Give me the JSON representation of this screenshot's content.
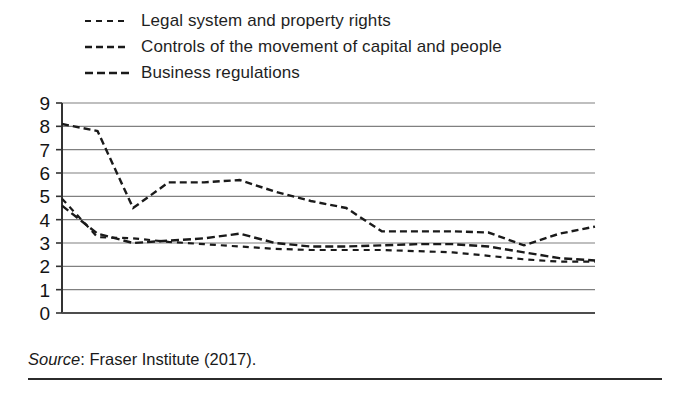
{
  "figure": {
    "caption_source_word": "Source",
    "caption_rest": ": Fraser Institute (2017).",
    "caption_full": "Source: Fraser Institute (2017)."
  },
  "legend": {
    "position": "top-left",
    "items": [
      {
        "label": "Legal system and property rights",
        "dash": "6,5",
        "width": 2.2,
        "color": "#1a1a1a"
      },
      {
        "label": "Controls of the movement of capital and people",
        "dash": "7,4",
        "width": 2.4,
        "color": "#1a1a1a"
      },
      {
        "label": "Business regulations",
        "dash": "8,4",
        "width": 2.4,
        "color": "#1a1a1a"
      }
    ]
  },
  "axes": {
    "y_ticks": [
      "0",
      "1",
      "2",
      "3",
      "4",
      "5",
      "6",
      "7",
      "8",
      "9"
    ],
    "x_ticks": [
      "2000",
      "2002",
      "2004",
      "2006",
      "2008",
      "2010",
      "2012",
      "2014"
    ],
    "grid": "horizontal",
    "grid_color": "#808080",
    "axis_color": "#4d4d4d"
  },
  "chart_data": {
    "type": "line",
    "title": "",
    "xlabel": "",
    "ylabel": "",
    "xlim": [
      2000,
      2015
    ],
    "ylim": [
      0,
      9
    ],
    "grid": true,
    "legend_position": "above-plot-left",
    "x": [
      2000,
      2001,
      2002,
      2003,
      2004,
      2005,
      2006,
      2007,
      2008,
      2009,
      2010,
      2011,
      2012,
      2013,
      2014,
      2015
    ],
    "x_tick_labels": [
      "2000",
      "2002",
      "2004",
      "2006",
      "2008",
      "2010",
      "2012",
      "2014"
    ],
    "y_tick_labels": [
      "0",
      "1",
      "2",
      "3",
      "4",
      "5",
      "6",
      "7",
      "8",
      "9"
    ],
    "series": [
      {
        "name": "Legal system and property rights",
        "values": [
          4.9,
          3.25,
          3.2,
          3.05,
          2.95,
          2.85,
          2.75,
          2.7,
          2.7,
          2.7,
          2.65,
          2.6,
          2.45,
          2.3,
          2.2,
          2.2
        ]
      },
      {
        "name": "Controls of the movement of capital and people",
        "values": [
          8.1,
          7.8,
          4.5,
          5.6,
          5.6,
          5.7,
          5.2,
          4.8,
          4.5,
          3.5,
          3.5,
          3.5,
          3.45,
          2.9,
          3.4,
          3.7
        ]
      },
      {
        "name": "Business regulations",
        "values": [
          4.6,
          3.4,
          3.0,
          3.1,
          3.2,
          3.4,
          3.0,
          2.85,
          2.85,
          2.9,
          2.95,
          2.95,
          2.85,
          2.6,
          2.35,
          2.25
        ]
      }
    ]
  }
}
